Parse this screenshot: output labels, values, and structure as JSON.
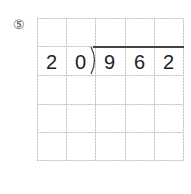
{
  "problem": {
    "number_label": "⑤",
    "divisor": [
      "2",
      "0"
    ],
    "dividend": [
      "9",
      "6",
      "2"
    ],
    "grid": {
      "columns": 5,
      "rows": 5
    }
  }
}
